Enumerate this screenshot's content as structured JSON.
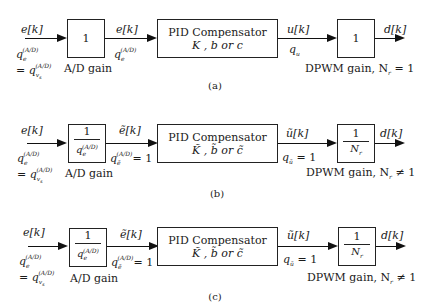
{
  "diagrams": [
    {
      "id": "a",
      "caption": "(a)",
      "input_signal": "e[k]",
      "input_quant_1": "q",
      "input_quant_1_sub": "e",
      "input_quant_1_sup": "(A/D)",
      "input_quant_2": "= q",
      "input_quant_2_sub": "v",
      "input_quant_2_subsub": "s",
      "input_quant_2_sup": "(A/D)",
      "ad_block": {
        "num": "1",
        "den": "",
        "label": "A/D gain"
      },
      "ad_out_signal": "e[k]",
      "ad_out_quant": "q",
      "ad_out_quant_sub": "e",
      "ad_out_quant_sup": "(A/D)",
      "ad_out_quant_suffix": "",
      "pid_block": {
        "title": "PID Compensator",
        "params": "K , b or c"
      },
      "pid_out_signal": "u[k]",
      "pid_out_quant": "q",
      "pid_out_quant_sub": "u",
      "pid_out_quant_suffix": "",
      "dpwm_block": {
        "num": "1",
        "den": "",
        "label": "DPWM gain, N",
        "label_sub": "r",
        "label_rel": "= 1"
      },
      "output_signal": "d[k]"
    },
    {
      "id": "b",
      "caption": "(b)",
      "input_signal": "e[k]",
      "input_quant_1": "q",
      "input_quant_1_sub": "e",
      "input_quant_1_sup": "(A/D)",
      "input_quant_2": "= q",
      "input_quant_2_sub": "v",
      "input_quant_2_subsub": "s",
      "input_quant_2_sup": "(A/D)",
      "ad_block": {
        "num": "1",
        "den": "q",
        "den_sub": "e",
        "den_sup": "(A/D)",
        "label": "A/D gain"
      },
      "ad_out_signal": "ẽ[k]",
      "ad_out_quant": "q",
      "ad_out_quant_sub": "ẽ",
      "ad_out_quant_sup": "(A/D)",
      "ad_out_quant_suffix": "= 1",
      "pid_block": {
        "title": "PID Compensator",
        "params": "K̃ , b̃ or c̃"
      },
      "pid_out_signal": "ũ[k]",
      "pid_out_quant": "q",
      "pid_out_quant_sub": "ũ",
      "pid_out_quant_suffix": "= 1",
      "dpwm_block": {
        "num": "1",
        "den": "N",
        "den_sub": "r",
        "label": "DPWM gain, N",
        "label_sub": "r",
        "label_rel": "≠ 1"
      },
      "output_signal": "d[k]"
    },
    {
      "id": "c",
      "caption": "(c)",
      "input_signal": "e[k]",
      "input_quant_1": "q",
      "input_quant_1_sub": "e",
      "input_quant_1_sup": "(A/D)",
      "input_quant_2": "= q",
      "input_quant_2_sub": "v",
      "input_quant_2_subsub": "s",
      "input_quant_2_sup": "(A/D)",
      "ad_block": {
        "num": "1",
        "den": "q",
        "den_sub": "e",
        "den_sup": "(A/D)",
        "label": "A/D gain"
      },
      "ad_out_signal": "ẽ[k]",
      "ad_out_quant": "q",
      "ad_out_quant_sub": "ẽ",
      "ad_out_quant_sup": "(A/D)",
      "ad_out_quant_suffix": "= 1",
      "pid_block": {
        "title": "PID Compensator",
        "params": "K̃ , b̃ or c̃"
      },
      "pid_out_signal": "ũ[k]",
      "pid_out_quant": "q",
      "pid_out_quant_sub": "ũ",
      "pid_out_quant_suffix": "= 1",
      "dpwm_block": {
        "num": "1",
        "den": "N",
        "den_sub": "r",
        "label": "DPWM gain, N",
        "label_sub": "r",
        "label_rel": "≠ 1"
      },
      "output_signal": "d[k]"
    }
  ]
}
